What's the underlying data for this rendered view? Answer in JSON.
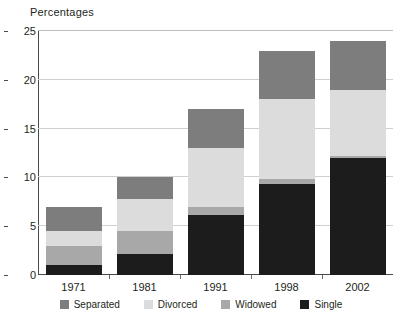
{
  "chart_data": {
    "type": "bar",
    "subtype": "stacked-bar",
    "title": "",
    "ylabel": "Percentages",
    "xlabel": "",
    "categories": [
      "1971",
      "1981",
      "1991",
      "1998",
      "2002"
    ],
    "ylim": [
      0,
      25
    ],
    "yticks": [
      0,
      5,
      10,
      15,
      20,
      25
    ],
    "grid": "horizontal",
    "legend_position": "bottom",
    "series": [
      {
        "name": "Single",
        "color": "#1c1c1c",
        "values": [
          1.0,
          2.2,
          6.2,
          9.3,
          12.0
        ]
      },
      {
        "name": "Widowed",
        "color": "#a8a8a8",
        "values": [
          2.0,
          2.3,
          0.8,
          0.5,
          0.2
        ]
      },
      {
        "name": "Divorced",
        "color": "#dcdcdc",
        "values": [
          1.5,
          3.3,
          6.0,
          8.2,
          6.8
        ]
      },
      {
        "name": "Separated",
        "color": "#7d7d7d",
        "values": [
          2.5,
          2.2,
          4.0,
          5.0,
          5.0
        ]
      }
    ],
    "totals": [
      7.0,
      10.0,
      17.0,
      23.0,
      24.0
    ],
    "legend_order": [
      "Separated",
      "Divorced",
      "Widowed",
      "Single"
    ],
    "stack_order_bottom_to_top": [
      "Single",
      "Widowed",
      "Divorced",
      "Separated"
    ]
  },
  "colors": {
    "axis": "#4a4a4a",
    "gridline": "#d0d0d0",
    "text": "#231f20",
    "background": "#ffffff"
  }
}
